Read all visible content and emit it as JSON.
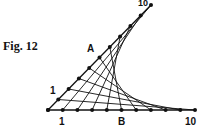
{
  "figure": {
    "caption": "Fig. 12",
    "labels": {
      "top_end": "10",
      "A": "A",
      "diag_start": "1",
      "base_start": "1",
      "B": "B",
      "base_end": "10"
    },
    "origin": [
      48,
      110
    ],
    "diagonal_end": [
      151,
      5
    ],
    "base_end": [
      195,
      110
    ],
    "points_per_arm": 10,
    "line_color": "#111111"
  }
}
